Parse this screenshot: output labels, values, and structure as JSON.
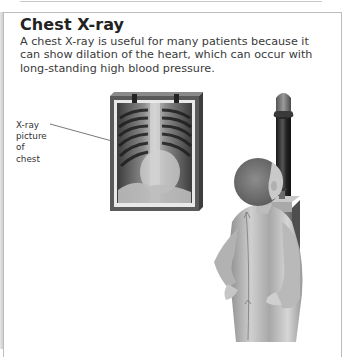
{
  "heading": "Chest X-ray",
  "description": "A chest X-ray is useful for many patients because it can show dilation of the heart, which can occur with long-standing high blood pressure.",
  "callout": {
    "lines": [
      "X-ray",
      "picture",
      "of",
      "chest"
    ]
  },
  "colors": {
    "border": "#bdbdbd",
    "heading": "#222222",
    "text": "#3a3a3a",
    "frame": "#5a5a5a",
    "machine": "#2a2a2a"
  }
}
